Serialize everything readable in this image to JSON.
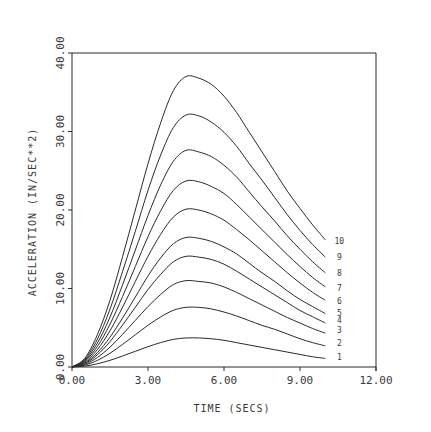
{
  "chart_data": {
    "type": "line",
    "title": "",
    "xlabel": "TIME (SECS)",
    "ylabel": "ACCELERATION (IN/SEC**2)",
    "xlim": [
      0,
      12
    ],
    "ylim": [
      0,
      40
    ],
    "x_ticks": [
      0,
      3,
      6,
      9,
      12
    ],
    "x_tick_labels": [
      "0.00",
      "3.00",
      "6.00",
      "9.00",
      "12.00"
    ],
    "y_ticks": [
      0,
      10,
      20,
      30,
      40
    ],
    "y_tick_labels": [
      "0.00",
      "10.00",
      "20.00",
      "30.00",
      "40.00"
    ],
    "grid": false,
    "legend": "inline curve labels at right end (1-10)",
    "line_color": "#2a2a2a",
    "x": [
      0,
      0.5,
      1,
      1.5,
      2,
      2.5,
      3,
      3.5,
      4,
      4.5,
      5,
      5.5,
      6,
      6.5,
      7,
      7.5,
      8,
      8.5,
      9,
      9.5,
      10
    ],
    "series": [
      {
        "name": "1",
        "values": [
          0,
          0.11,
          0.41,
          0.85,
          1.41,
          2.0,
          2.59,
          3.11,
          3.52,
          3.7,
          3.7,
          3.6,
          3.4,
          3.1,
          2.8,
          2.5,
          2.2,
          1.9,
          1.6,
          1.3,
          1.1
        ]
      },
      {
        "name": "2",
        "values": [
          0,
          0.23,
          0.84,
          1.75,
          2.89,
          4.1,
          5.32,
          6.38,
          7.22,
          7.6,
          7.6,
          7.4,
          7.0,
          6.5,
          5.9,
          5.3,
          4.8,
          4.2,
          3.6,
          3.1,
          2.7
        ]
      },
      {
        "name": "3",
        "values": [
          0,
          0.33,
          1.21,
          2.53,
          4.18,
          5.94,
          7.7,
          9.24,
          10.5,
          11.0,
          10.9,
          10.7,
          10.2,
          9.5,
          8.7,
          7.9,
          7.1,
          6.3,
          5.6,
          4.9,
          4.3
        ]
      },
      {
        "name": "4",
        "values": [
          0,
          0.42,
          1.55,
          3.24,
          5.36,
          7.61,
          9.87,
          11.8,
          13.4,
          14.1,
          14.0,
          13.7,
          13.1,
          12.2,
          11.2,
          10.2,
          9.2,
          8.2,
          7.2,
          6.4,
          5.6
        ]
      },
      {
        "name": "5",
        "values": [
          0,
          0.5,
          1.82,
          3.8,
          6.27,
          8.91,
          11.6,
          13.9,
          15.7,
          16.5,
          16.4,
          16.0,
          15.3,
          14.4,
          13.2,
          12.0,
          10.9,
          9.7,
          8.6,
          7.7,
          6.8
        ]
      },
      {
        "name": "6",
        "values": [
          0,
          0.6,
          2.21,
          4.62,
          7.64,
          10.9,
          14.1,
          16.9,
          19.1,
          20.1,
          20.0,
          19.5,
          18.7,
          17.5,
          16.2,
          14.8,
          13.4,
          12.0,
          10.7,
          9.5,
          8.5
        ]
      },
      {
        "name": "7",
        "values": [
          0,
          0.71,
          2.61,
          5.45,
          9.0,
          12.8,
          16.6,
          19.9,
          22.5,
          23.7,
          23.6,
          23.0,
          22.1,
          20.7,
          19.1,
          17.5,
          15.9,
          14.3,
          12.8,
          11.4,
          10.2
        ]
      },
      {
        "name": "8",
        "values": [
          0,
          0.83,
          3.04,
          6.35,
          10.5,
          14.9,
          19.3,
          23.2,
          26.2,
          27.6,
          27.4,
          26.8,
          25.7,
          24.2,
          22.3,
          20.4,
          18.6,
          16.7,
          15.0,
          13.4,
          12.0
        ]
      },
      {
        "name": "9",
        "values": [
          0,
          0.96,
          3.53,
          7.38,
          12.2,
          17.3,
          22.5,
          27.0,
          30.5,
          32.1,
          32.0,
          31.2,
          29.9,
          28.1,
          25.9,
          23.8,
          21.6,
          19.4,
          17.4,
          15.6,
          14.0
        ]
      },
      {
        "name": "10",
        "values": [
          0,
          1.1,
          4.1,
          8.5,
          14.1,
          20.0,
          25.9,
          31.1,
          35.2,
          37.0,
          36.8,
          36.0,
          34.5,
          32.4,
          29.9,
          27.4,
          24.9,
          22.4,
          20.2,
          18.1,
          16.2
        ]
      }
    ],
    "curve_label_y": [
      1.3,
      3.1,
      4.7,
      6.0,
      6.9,
      8.4,
      10.1,
      12.0,
      14.0,
      16.0
    ]
  }
}
